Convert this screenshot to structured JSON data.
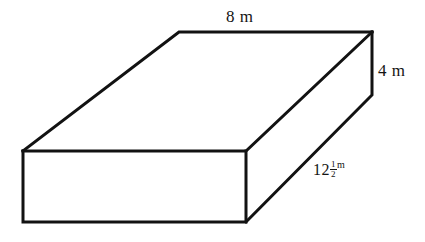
{
  "figure": {
    "kind": "rectangular-prism",
    "background_color": "#ffffff",
    "line_color": "#121212",
    "face_fill": "#ffffff"
  },
  "labels": {
    "width": "8 m",
    "height": "4 m",
    "depth": {
      "whole": "12",
      "numerator": "1",
      "denominator": "2",
      "unit": "m",
      "full_text": "12 1/2 m"
    }
  },
  "geometry": {
    "front_top_left": [
      23,
      151
    ],
    "front_top_right": [
      246,
      151
    ],
    "front_bottom_right": [
      246,
      222
    ],
    "front_bottom_left": [
      23,
      222
    ],
    "back_top_left": [
      179,
      32
    ],
    "back_top_right": [
      372,
      32
    ],
    "right_back_bottom": [
      372,
      95
    ]
  }
}
